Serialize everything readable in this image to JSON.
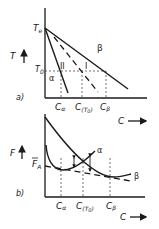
{
  "panel_a": {
    "tag": "a)",
    "y_axis_label": "T",
    "x_axis_label": "C",
    "te_label": "T",
    "te_sub": "e",
    "t0_label": "T",
    "t0_sub": "0",
    "region_II": "II",
    "region_I": "I",
    "phase_alpha": "α",
    "phase_beta": "β",
    "ticks": [
      {
        "main": "C",
        "sub": "α"
      },
      {
        "main": "C",
        "sub": "(T",
        "sub2": "0",
        "close": ")"
      },
      {
        "main": "C",
        "sub": "β"
      }
    ]
  },
  "panel_b": {
    "tag": "b)",
    "y_axis_label": "F",
    "x_axis_label": "C",
    "fa_label": "F",
    "fa_sub": "A",
    "curve_alpha": "α",
    "curve_beta": "β",
    "ticks": [
      {
        "main": "C",
        "sub": "α"
      },
      {
        "main": "C",
        "sub": "(T",
        "sub2": "0",
        "close": ")"
      },
      {
        "main": "C",
        "sub": "β"
      }
    ]
  }
}
